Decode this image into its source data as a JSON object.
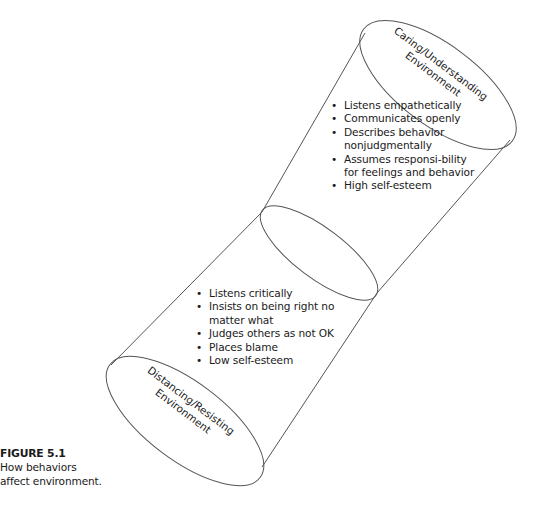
{
  "figure": {
    "number_label": "FIGURE 5.1",
    "caption_line1": "How behaviors",
    "caption_line2": "affect environment."
  },
  "top_environment": {
    "label_line1": "Caring/Understanding",
    "label_line2": "Environment",
    "behaviors": [
      "Listens empathetically",
      "Communicates openly",
      "Describes behavior nonjudgmentally",
      "Assumes responsi-bility for feelings and behavior",
      "High self-esteem"
    ]
  },
  "bottom_environment": {
    "label_line1": "Distancing/Resisting",
    "label_line2": "Environment",
    "behaviors": [
      "Listens critically",
      "Insists on being right no matter what",
      "Judges others as not OK",
      "Places blame",
      "Low self-esteem"
    ]
  },
  "colors": {
    "stroke": "#555555",
    "text": "#1a1a1a",
    "background": "#ffffff"
  }
}
